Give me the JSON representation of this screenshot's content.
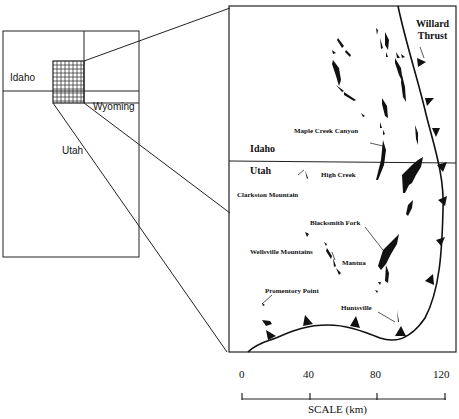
{
  "overview_map": {
    "labels": {
      "idaho": "Idaho",
      "wyoming": "Wyoming",
      "utah": "Utah"
    }
  },
  "detail_map": {
    "state_labels": {
      "idaho": "Idaho",
      "utah": "Utah"
    },
    "fault_label": [
      "Willard",
      "Thrust"
    ],
    "localities": {
      "maple_creek": "Maple Creek Canyon",
      "high_creek": "High Creek",
      "clarkston": "Clarkston Mountain",
      "blacksmith": "Blacksmith Fork",
      "wellsville": "Wellsville Mountains",
      "mantua": "Mantua",
      "promontory": "Promentory Point",
      "huntsville": "Huntsville"
    }
  },
  "scale_bar": {
    "ticks": [
      "0",
      "40",
      "80",
      "120"
    ],
    "title": "SCALE (km)"
  },
  "colors": {
    "ink": "#111111",
    "paper": "#ffffff"
  }
}
